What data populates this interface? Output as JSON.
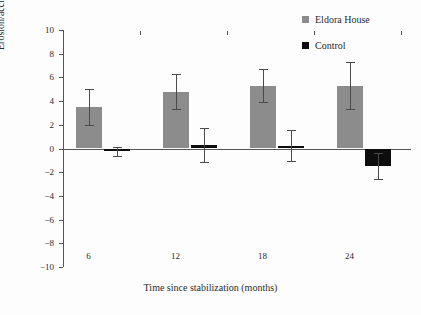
{
  "chart_data": {
    "type": "bar",
    "title": "",
    "xlabel": "Time since stabilization (months)",
    "ylabel": "Erosion/accretion (cm ± SE)",
    "categories": [
      "6",
      "12",
      "18",
      "24"
    ],
    "ylim": [
      -10,
      10
    ],
    "ytick_labels": [
      "10",
      "8",
      "6",
      "4",
      "2",
      "0",
      "−2",
      "−4",
      "−6",
      "−8",
      "−10"
    ],
    "ytick_values": [
      10,
      8,
      6,
      4,
      2,
      0,
      -2,
      -4,
      -6,
      -8,
      -10
    ],
    "grid": false,
    "legend_position": "top-right",
    "series": [
      {
        "name": "Eldora House",
        "color": "#8c8c8c",
        "values": [
          3.5,
          4.8,
          5.3,
          5.3
        ],
        "errors": [
          1.5,
          1.5,
          1.4,
          2.0
        ]
      },
      {
        "name": "Control",
        "color": "#0d0d0d",
        "values": [
          -0.25,
          0.3,
          0.25,
          -1.5
        ],
        "errors": [
          0.35,
          1.4,
          1.3,
          1.1
        ]
      }
    ]
  },
  "legend": {
    "items": [
      {
        "label": "Eldora House",
        "color": "#8c8c8c"
      },
      {
        "label": "Control",
        "color": "#0d0d0d"
      }
    ]
  },
  "axes": {
    "y_title": "Erosion/accretion (cm ± SE)",
    "x_title": "Time since stabilization (months)"
  }
}
